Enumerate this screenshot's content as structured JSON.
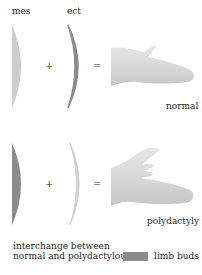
{
  "labels": {
    "mes": "mes",
    "ect": "ect",
    "plus": "+",
    "equals": "=",
    "normal": "normal",
    "polydactyly": "polydactyly"
  },
  "legend": {
    "line1": "interchange between",
    "line2": "normal and polydactylous",
    "swatch_label": "limb buds",
    "swatch_color": "#8c8c8c"
  },
  "colors": {
    "light_tissue": "#cdcdcd",
    "dark_tissue": "#8c8c8c",
    "limb_fill": "#d6d6d6",
    "limb_highlight": "#ececec"
  },
  "rows": [
    {
      "name": "normal",
      "mes_shade": "light",
      "ect_shade": "dark",
      "result": "normal"
    },
    {
      "name": "polydactyly",
      "mes_shade": "dark",
      "ect_shade": "light",
      "result": "polydactyly"
    }
  ]
}
